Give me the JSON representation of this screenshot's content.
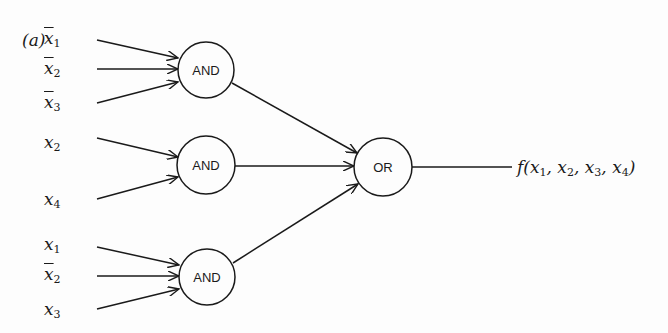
{
  "figure": {
    "panel_label": "(a)",
    "gates": [
      {
        "id": "and1",
        "type": "AND",
        "label": "AND",
        "cx": 206,
        "cy": 70,
        "r": 28
      },
      {
        "id": "and2",
        "type": "AND",
        "label": "AND",
        "cx": 206,
        "cy": 165,
        "r": 29
      },
      {
        "id": "and3",
        "type": "AND",
        "label": "AND",
        "cx": 207,
        "cy": 277,
        "r": 28
      },
      {
        "id": "or1",
        "type": "OR",
        "label": "OR",
        "cx": 383,
        "cy": 167,
        "r": 29
      }
    ],
    "inputs": [
      {
        "var": "x",
        "sub": "1",
        "negated": true,
        "gate": "and1"
      },
      {
        "var": "x",
        "sub": "2",
        "negated": true,
        "gate": "and1"
      },
      {
        "var": "x",
        "sub": "3",
        "negated": true,
        "gate": "and1"
      },
      {
        "var": "x",
        "sub": "2",
        "negated": false,
        "gate": "and2"
      },
      {
        "var": "x",
        "sub": "4",
        "negated": false,
        "gate": "and2"
      },
      {
        "var": "x",
        "sub": "1",
        "negated": false,
        "gate": "and3"
      },
      {
        "var": "x",
        "sub": "2",
        "negated": true,
        "gate": "and3"
      },
      {
        "var": "x",
        "sub": "3",
        "negated": false,
        "gate": "and3"
      }
    ],
    "output": {
      "func": "f",
      "args": [
        "x1",
        "x2",
        "x3",
        "x4"
      ],
      "text_f": "f(",
      "arg_vars": [
        "x",
        "x",
        "x",
        "x"
      ],
      "arg_subs": [
        "1",
        "2",
        "3",
        "4"
      ],
      "sep": ", ",
      "close": ")"
    }
  }
}
